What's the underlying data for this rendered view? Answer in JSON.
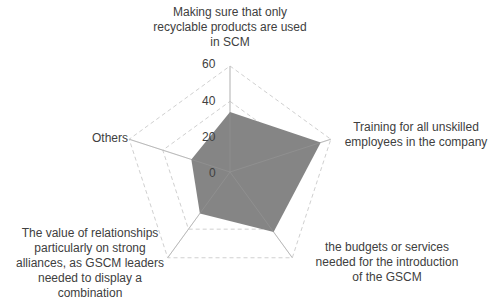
{
  "chart_data": {
    "type": "radar",
    "title": "",
    "categories": [
      "Making sure that only recyclable products are used in SCM",
      "Training for all unskilled employees in the company",
      "the budgets or services needed for the introduction of the GSCM",
      "The value of relationships particularly on strong alliances, as GSCM leaders needed to display a combination",
      "Others"
    ],
    "series": [
      {
        "name": "Series1",
        "values": [
          34,
          54,
          42,
          29,
          23
        ],
        "color": "#858585"
      }
    ],
    "rlim": [
      0,
      60
    ],
    "ticks": [
      "0",
      "20",
      "40",
      "60"
    ],
    "grid": true,
    "legend": "none"
  },
  "labels": {
    "cat0": [
      "Making sure that only",
      "recyclable products are used",
      "in SCM"
    ],
    "cat1": [
      "Training for all unskilled",
      "employees in the company"
    ],
    "cat2": [
      "the budgets or services",
      "needed for the introduction",
      "of the GSCM"
    ],
    "cat3": [
      "The value of relationships",
      "particularly on strong",
      "alliances, as GSCM leaders",
      "needed to display a",
      "combination"
    ],
    "cat4": [
      "Others"
    ]
  }
}
